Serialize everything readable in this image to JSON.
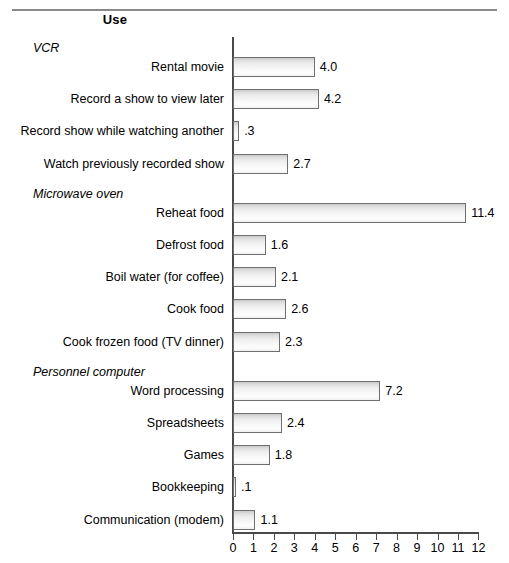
{
  "header": {
    "column_title": "Use"
  },
  "chart_data": {
    "type": "bar",
    "orientation": "horizontal",
    "title": "Use",
    "xlabel": "",
    "ylabel": "",
    "xlim": [
      0,
      12
    ],
    "xticks": [
      "0",
      "1",
      "2",
      "3",
      "4",
      "5",
      "6",
      "7",
      "8",
      "9",
      "10",
      "11",
      "12"
    ],
    "grid": false,
    "legend": "none",
    "groups": [
      {
        "name": "VCR",
        "items": [
          {
            "label": "Rental movie",
            "value": 4.0,
            "value_label": "4.0"
          },
          {
            "label": "Record a show to view later",
            "value": 4.2,
            "value_label": "4.2"
          },
          {
            "label": "Record show while watching another",
            "value": 0.3,
            "value_label": ".3"
          },
          {
            "label": "Watch previously recorded show",
            "value": 2.7,
            "value_label": "2.7"
          }
        ]
      },
      {
        "name": "Microwave oven",
        "items": [
          {
            "label": "Reheat food",
            "value": 11.4,
            "value_label": "11.4"
          },
          {
            "label": "Defrost food",
            "value": 1.6,
            "value_label": "1.6"
          },
          {
            "label": "Boil water (for coffee)",
            "value": 2.1,
            "value_label": "2.1"
          },
          {
            "label": "Cook food",
            "value": 2.6,
            "value_label": "2.6"
          },
          {
            "label": "Cook frozen food (TV dinner)",
            "value": 2.3,
            "value_label": "2.3"
          }
        ]
      },
      {
        "name": "Personnel computer",
        "items": [
          {
            "label": "Word processing",
            "value": 7.2,
            "value_label": "7.2"
          },
          {
            "label": "Spreadsheets",
            "value": 2.4,
            "value_label": "2.4"
          },
          {
            "label": "Games",
            "value": 1.8,
            "value_label": "1.8"
          },
          {
            "label": "Bookkeeping",
            "value": 0.1,
            "value_label": ".1"
          },
          {
            "label": "Communication (modem)",
            "value": 1.1,
            "value_label": "1.1"
          }
        ]
      }
    ],
    "colors": {
      "bar_border": "#6f6f6f",
      "bar_fill_top": "#c9c9c9",
      "bar_fill_bottom": "#fdfdfd",
      "axis": "#4a4a4a",
      "text": "#000000",
      "rule": "#8a8a8a"
    }
  }
}
